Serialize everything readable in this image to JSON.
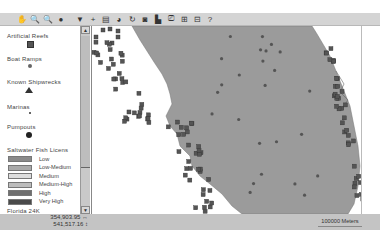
{
  "toolbar": {
    "buttons": [
      {
        "name": "pan-icon",
        "glyph": "✋"
      },
      {
        "name": "zoom-in-icon",
        "glyph": "🔍"
      },
      {
        "name": "zoom-out-icon",
        "glyph": "🔍"
      },
      {
        "name": "info-icon",
        "glyph": "●"
      },
      {
        "name": "sep"
      },
      {
        "name": "select-icon",
        "glyph": "▼"
      },
      {
        "name": "add-point-icon",
        "glyph": "+"
      },
      {
        "name": "layers-icon",
        "glyph": "▤"
      },
      {
        "name": "refresh-icon",
        "glyph": "◕"
      },
      {
        "name": "rotate-icon",
        "glyph": "↻"
      },
      {
        "name": "identify-icon",
        "glyph": "◙"
      },
      {
        "name": "print-icon",
        "glyph": "▙"
      },
      {
        "name": "save-icon",
        "glyph": "⎚"
      },
      {
        "name": "measure-icon",
        "glyph": "⊞"
      },
      {
        "name": "overview-icon",
        "glyph": "⊟"
      },
      {
        "name": "help-icon",
        "glyph": "?"
      }
    ]
  },
  "legend": {
    "layers": [
      {
        "label": "Artificial Reefs",
        "symbol": "square"
      },
      {
        "label": "Boat Ramps",
        "symbol": "circle-x"
      },
      {
        "label": "Known Shipwrecks",
        "symbol": "triangle"
      },
      {
        "label": "Marinas",
        "symbol": "dot"
      },
      {
        "label": "Pumpouts",
        "symbol": "big-dot"
      }
    ],
    "license_title": "Saltwater Fish Licens",
    "license_classes": [
      {
        "label": "Low",
        "color": "#8a8a8a"
      },
      {
        "label": "Low-Medium",
        "color": "#aaaaaa"
      },
      {
        "label": "Medium",
        "color": "#dddddd"
      },
      {
        "label": "Medium-High",
        "color": "#bdbdbd"
      },
      {
        "label": "High",
        "color": "#6f6f6f"
      },
      {
        "label": "Very High",
        "color": "#4a4a4a"
      }
    ],
    "next_layer": "Florida 24K"
  },
  "status": {
    "x_coord": "354,903.95 ↔",
    "y_coord": "541,517.16 ↕",
    "scale_label": "100000 Meters"
  },
  "colors": {
    "land": "#9b9b9b",
    "marker": "#555555",
    "toolbar": "#d4d4d4"
  }
}
